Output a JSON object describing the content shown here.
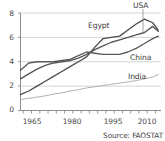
{
  "chart_data": {
    "type": "line",
    "title": "",
    "subtitle": "",
    "xlabel": "",
    "ylabel": "",
    "xlim": [
      1961,
      2012
    ],
    "ylim": [
      0,
      8
    ],
    "yticks": [
      0,
      2,
      4,
      6,
      8
    ],
    "ytick_labels": [
      "0",
      "2",
      "4",
      "6",
      "8"
    ],
    "xticks": [
      1965,
      1980,
      1995,
      2010
    ],
    "xtick_labels": [
      "1965",
      "1980",
      "1995",
      "2010"
    ],
    "minor_xtick_step": 3,
    "grid": "horizontal",
    "legend_position": "inline-labels",
    "annotations": [
      {
        "text": "USA",
        "kind": "series-label-with-leader",
        "points_to_year": 2009
      },
      {
        "text": "Egypt",
        "kind": "series-label"
      },
      {
        "text": "China",
        "kind": "series-label"
      },
      {
        "text": "India",
        "kind": "series-label"
      }
    ],
    "source": "Source: FAOSTAT",
    "series": [
      {
        "name": "Egypt",
        "color": "#4d4d4d",
        "x": [
          1961,
          1964,
          1967,
          1970,
          1973,
          1976,
          1979,
          1982,
          1985,
          1988,
          1991,
          1994,
          1997,
          2000,
          2003,
          2006,
          2009,
          2011
        ],
        "values": [
          1.3,
          1.6,
          2.0,
          2.4,
          2.8,
          3.2,
          3.6,
          4.0,
          4.4,
          5.2,
          5.9,
          6.0,
          6.1,
          6.6,
          7.1,
          7.5,
          7.2,
          6.6
        ]
      },
      {
        "name": "USA",
        "color": "#555555",
        "x": [
          1961,
          1964,
          1967,
          1970,
          1973,
          1976,
          1979,
          1982,
          1985,
          1988,
          1991,
          1994,
          1997,
          2000,
          2003,
          2006,
          2009,
          2011
        ],
        "values": [
          2.6,
          3.0,
          3.4,
          3.7,
          3.9,
          4.0,
          4.1,
          4.3,
          4.6,
          5.0,
          5.3,
          5.6,
          5.8,
          6.0,
          6.2,
          6.4,
          6.9,
          6.5
        ]
      },
      {
        "name": "China",
        "color": "#5a5a5a",
        "x": [
          1961,
          1964,
          1967,
          1970,
          1973,
          1976,
          1979,
          1982,
          1985,
          1988,
          1991,
          1994,
          1997,
          2000,
          2003,
          2006,
          2009,
          2011
        ],
        "values": [
          3.3,
          3.9,
          4.0,
          4.0,
          4.0,
          4.1,
          4.2,
          4.5,
          4.8,
          4.7,
          4.6,
          4.6,
          4.6,
          4.8,
          5.1,
          5.5,
          5.9,
          6.1
        ]
      },
      {
        "name": "India",
        "color": "#a8a8a8",
        "x": [
          1961,
          1964,
          1967,
          1970,
          1973,
          1976,
          1979,
          1982,
          1985,
          1988,
          1991,
          1994,
          1997,
          2000,
          2003,
          2006,
          2009,
          2011
        ],
        "values": [
          0.9,
          1.0,
          1.1,
          1.2,
          1.35,
          1.45,
          1.6,
          1.7,
          1.85,
          1.95,
          2.05,
          2.15,
          2.25,
          2.35,
          2.45,
          2.6,
          2.75,
          2.95
        ]
      }
    ]
  },
  "labels": {
    "usa": "USA",
    "egypt": "Egypt",
    "china": "China",
    "india": "India"
  },
  "source_text": "Source: FAOSTAT",
  "colors": {
    "grid": "#cfcfcf",
    "axis": "#8f8f8f",
    "dark_series": "#4d4d4d",
    "light_series": "#a8a8a8",
    "text": "#3d3d3d"
  }
}
